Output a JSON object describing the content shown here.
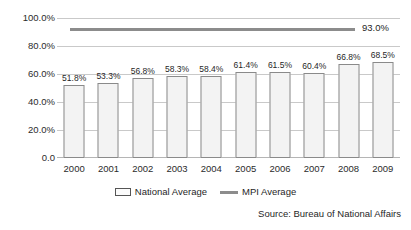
{
  "chart_data": {
    "type": "bar",
    "title": "",
    "subtitle": "",
    "xlabel": "",
    "ylabel": "",
    "categories": [
      "2000",
      "2001",
      "2002",
      "2003",
      "2004",
      "2005",
      "2006",
      "2007",
      "2008",
      "2009"
    ],
    "series": [
      {
        "name": "National Average",
        "type": "bar",
        "values": [
          51.8,
          53.3,
          56.8,
          58.3,
          58.4,
          61.4,
          61.5,
          60.4,
          66.8,
          68.5
        ],
        "data_labels": [
          "51.8%",
          "53.3%",
          "56.8%",
          "58.3%",
          "58.4%",
          "61.4%",
          "61.5%",
          "60.4%",
          "66.8%",
          "68.5%"
        ],
        "color": "#f3f3f3",
        "border_color": "#8a8a8a"
      },
      {
        "name": "MPI Average",
        "type": "line",
        "constant_value": 93.0,
        "data_labels": [
          "93.0%"
        ],
        "color": "#8c8c8c"
      }
    ],
    "ylim": [
      0,
      100
    ],
    "yticks": [
      0,
      20,
      40,
      60,
      80,
      100
    ],
    "ytick_labels": [
      "0.0",
      "20.0%",
      "40.0%",
      "60.0%",
      "80.0%",
      "100.0%"
    ],
    "grid": true,
    "legend_position": "bottom",
    "annotations": [
      "Source: Bureau of National Affairs"
    ]
  },
  "axis": {
    "y_labels": [
      "100.0%",
      "80.0%",
      "60.0%",
      "40.0%",
      "20.0%",
      "0.0"
    ],
    "x_labels": [
      "2000",
      "2001",
      "2002",
      "2003",
      "2004",
      "2005",
      "2006",
      "2007",
      "2008",
      "2009"
    ]
  },
  "bars": [
    {
      "category": "2000",
      "value": 51.8,
      "label": "51.8%"
    },
    {
      "category": "2001",
      "value": 53.3,
      "label": "53.3%"
    },
    {
      "category": "2002",
      "value": 56.8,
      "label": "56.8%"
    },
    {
      "category": "2003",
      "value": 58.3,
      "label": "58.3%"
    },
    {
      "category": "2004",
      "value": 58.4,
      "label": "58.4%"
    },
    {
      "category": "2005",
      "value": 61.4,
      "label": "61.4%"
    },
    {
      "category": "2006",
      "value": 61.5,
      "label": "61.5%"
    },
    {
      "category": "2007",
      "value": 60.4,
      "label": "60.4%"
    },
    {
      "category": "2008",
      "value": 66.8,
      "label": "66.8%"
    },
    {
      "category": "2009",
      "value": 68.5,
      "label": "68.5%"
    }
  ],
  "mpi": {
    "value": 93.0,
    "label": "93.0%"
  },
  "legend": {
    "items": [
      {
        "label": "National Average",
        "marker": "bar-swatch",
        "color": "#f3f3f3"
      },
      {
        "label": "MPI Average",
        "marker": "line-swatch",
        "color": "#8c8c8c"
      }
    ]
  },
  "source": {
    "text": "Source: Bureau of National Affairs"
  },
  "colors": {
    "bar_fill": "#f3f3f3",
    "bar_border": "#8a8a8a",
    "line": "#8c8c8c",
    "grid": "#c9c9c9",
    "text": "#1f1f1f",
    "background": "#ffffff"
  }
}
